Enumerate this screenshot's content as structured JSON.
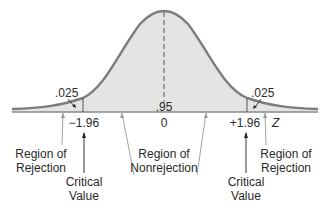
{
  "diagram": {
    "type": "normal-distribution-two-tailed-test",
    "curve": {
      "fill": "#e3e3e3",
      "stroke": "#7a7a7a"
    },
    "areas": {
      "left_tail": ".025",
      "center": ".95",
      "right_tail": ".025"
    },
    "axis": {
      "variable": "Z",
      "ticks": [
        "−1.96",
        "0",
        "+1.96"
      ]
    },
    "labels": {
      "left_region": [
        "Region of",
        "Rejection"
      ],
      "center_region": [
        "Region of",
        "Nonrejection"
      ],
      "right_region": [
        "Region of",
        "Rejection"
      ],
      "left_critical": [
        "Critical",
        "Value"
      ],
      "right_critical": [
        "Critical",
        "Value"
      ]
    }
  }
}
